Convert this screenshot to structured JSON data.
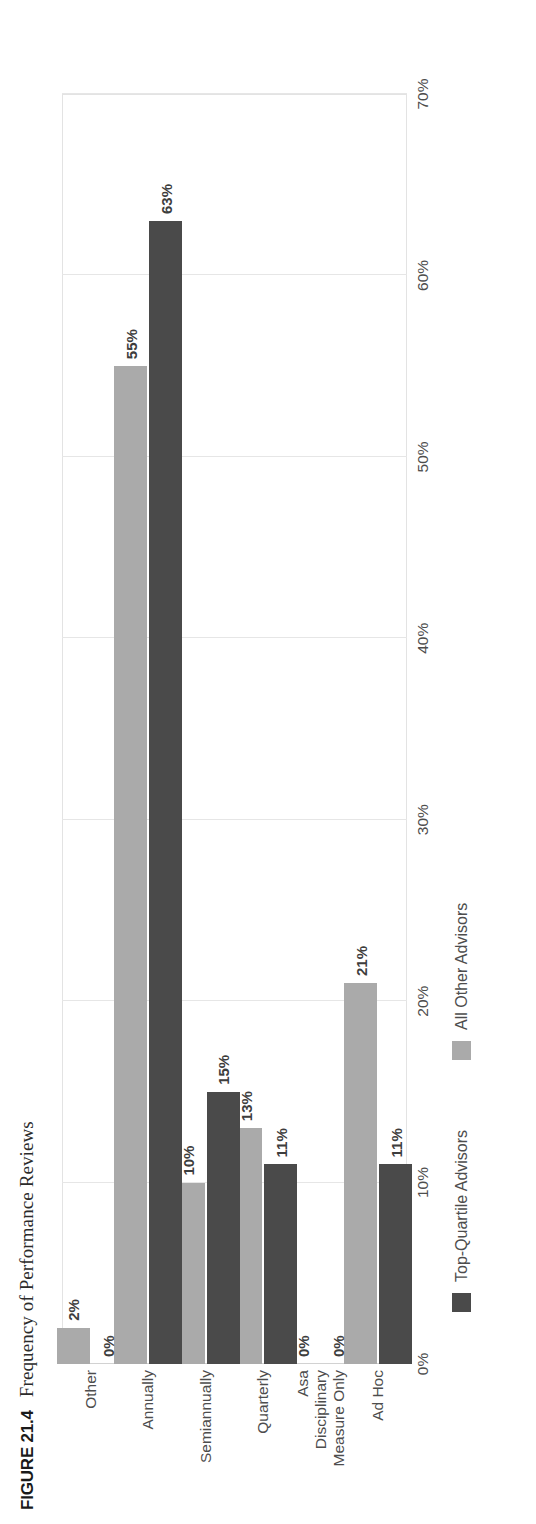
{
  "figure": {
    "label": "FIGURE 21.4",
    "title": "Frequency of Performance Reviews"
  },
  "colors": {
    "top_quartile": "#4a4a4a",
    "all_other": "#aaaaaa",
    "grid": "#e6e6e6",
    "text": "#4d4d4d"
  },
  "chart_data": {
    "type": "bar",
    "orientation": "vertical",
    "title": "Frequency of Performance Reviews",
    "xlabel": "",
    "ylabel": "",
    "ylim": [
      0,
      70
    ],
    "grid": true,
    "legend_position": "bottom",
    "categories": [
      "Ad Hoc",
      "Asa Disciplinary Measure Only",
      "Quarterly",
      "Semiannually",
      "Annually",
      "Other"
    ],
    "category_lines": [
      [
        "Ad Hoc"
      ],
      [
        "Asa",
        "Disciplinary",
        "Measure Only"
      ],
      [
        "Quarterly"
      ],
      [
        "Semiannually"
      ],
      [
        "Annually"
      ],
      [
        "Other"
      ]
    ],
    "series": [
      {
        "name": "Top-Quartile Advisors",
        "color": "#4a4a4a",
        "values": [
          11,
          0,
          11,
          15,
          63,
          0
        ],
        "labels": [
          "11%",
          "0%",
          "11%",
          "15%",
          "63%",
          "0%"
        ]
      },
      {
        "name": "All Other Advisors",
        "color": "#aaaaaa",
        "values": [
          21,
          0,
          13,
          10,
          55,
          2
        ],
        "labels": [
          "21%",
          "0%",
          "13%",
          "10%",
          "55%",
          "2%"
        ]
      }
    ],
    "ticks": [
      {
        "value": 0,
        "label": "0%"
      },
      {
        "value": 10,
        "label": "10%"
      },
      {
        "value": 20,
        "label": "20%"
      },
      {
        "value": 30,
        "label": "30%"
      },
      {
        "value": 40,
        "label": "40%"
      },
      {
        "value": 50,
        "label": "50%"
      },
      {
        "value": 60,
        "label": "60%"
      },
      {
        "value": 70,
        "label": "70%"
      }
    ]
  },
  "legend": {
    "items": [
      {
        "label": "Top-Quartile Advisors",
        "swatch": "dark"
      },
      {
        "label": "All Other Advisors",
        "swatch": "light"
      }
    ]
  }
}
